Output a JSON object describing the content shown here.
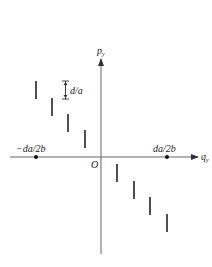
{
  "diagram": {
    "axes": {
      "x_label": "q",
      "x_sub": "y",
      "y_label": "p",
      "y_sub": "y",
      "origin_label": "O"
    },
    "points": {
      "left_label": "−da/2b",
      "right_label": "da/2b"
    },
    "bracket_label": "d/a",
    "segments": {
      "left": [
        {
          "x": 36,
          "y1": 81,
          "y2": 99
        },
        {
          "x": 52,
          "y1": 98,
          "y2": 116
        },
        {
          "x": 68,
          "y1": 114,
          "y2": 132
        },
        {
          "x": 85,
          "y1": 130,
          "y2": 148
        }
      ],
      "right": [
        {
          "x": 117,
          "y1": 164,
          "y2": 182
        },
        {
          "x": 134,
          "y1": 181,
          "y2": 199
        },
        {
          "x": 150,
          "y1": 197,
          "y2": 215
        },
        {
          "x": 167,
          "y1": 214,
          "y2": 232
        }
      ]
    },
    "colors": {
      "axis": "#555555",
      "segment": "#222222",
      "text": "#222222"
    }
  }
}
